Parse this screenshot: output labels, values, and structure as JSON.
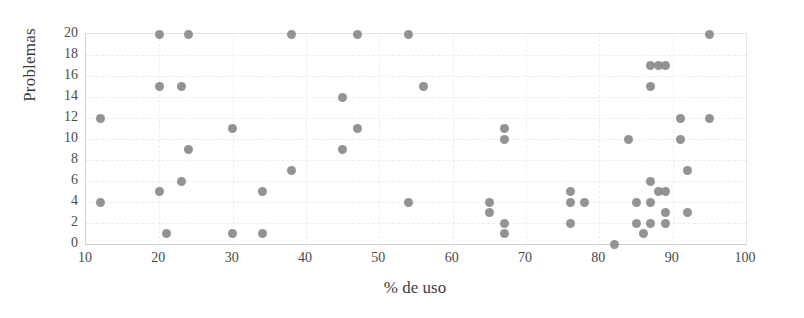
{
  "chart_data": {
    "type": "scatter",
    "title": "",
    "xlabel": "% de uso",
    "ylabel": "Problemas",
    "xlim": [
      10,
      100
    ],
    "ylim": [
      0,
      20
    ],
    "xticks": [
      10,
      20,
      30,
      40,
      50,
      60,
      70,
      80,
      90,
      100
    ],
    "yticks": [
      0,
      2,
      4,
      6,
      8,
      10,
      12,
      14,
      16,
      18,
      20
    ],
    "grid": true,
    "legend": null,
    "marker_color": "#8a8a8a",
    "series": [
      {
        "name": "observaciones",
        "points": [
          [
            12,
            12
          ],
          [
            12,
            4
          ],
          [
            20,
            20
          ],
          [
            20,
            15
          ],
          [
            20,
            5
          ],
          [
            21,
            1
          ],
          [
            23,
            15
          ],
          [
            23,
            6
          ],
          [
            24,
            20
          ],
          [
            24,
            9
          ],
          [
            30,
            11
          ],
          [
            30,
            1
          ],
          [
            34,
            5
          ],
          [
            34,
            1
          ],
          [
            38,
            20
          ],
          [
            38,
            7
          ],
          [
            45,
            14
          ],
          [
            45,
            9
          ],
          [
            47,
            20
          ],
          [
            47,
            11
          ],
          [
            54,
            20
          ],
          [
            54,
            4
          ],
          [
            56,
            15
          ],
          [
            65,
            4
          ],
          [
            65,
            3
          ],
          [
            67,
            11
          ],
          [
            67,
            10
          ],
          [
            67,
            2
          ],
          [
            67,
            1
          ],
          [
            76,
            5
          ],
          [
            76,
            4
          ],
          [
            76,
            2
          ],
          [
            78,
            4
          ],
          [
            82,
            0
          ],
          [
            84,
            10
          ],
          [
            85,
            4
          ],
          [
            85,
            2
          ],
          [
            86,
            1
          ],
          [
            87,
            15
          ],
          [
            87,
            17
          ],
          [
            87,
            6
          ],
          [
            87,
            4
          ],
          [
            87,
            2
          ],
          [
            88,
            17
          ],
          [
            88,
            5
          ],
          [
            89,
            17
          ],
          [
            89,
            5
          ],
          [
            89,
            3
          ],
          [
            89,
            2
          ],
          [
            91,
            12
          ],
          [
            91,
            10
          ],
          [
            92,
            7
          ],
          [
            92,
            3
          ],
          [
            95,
            20
          ],
          [
            95,
            12
          ]
        ]
      }
    ]
  },
  "axes": {
    "y_title": "Problemas",
    "x_title": "% de uso",
    "y_tick_labels": [
      "0",
      "2",
      "4",
      "6",
      "8",
      "10",
      "12",
      "14",
      "16",
      "18",
      "20"
    ],
    "x_tick_labels": [
      "10",
      "20",
      "30",
      "40",
      "50",
      "60",
      "70",
      "80",
      "90",
      "100"
    ]
  }
}
